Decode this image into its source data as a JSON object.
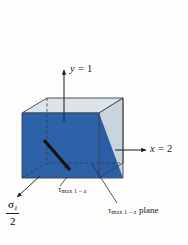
{
  "figure": {
    "name": "maximum-shear-stress-element",
    "background_color": "#fdfdfb",
    "colors": {
      "top_face": "#dde4e9",
      "right_face": "#c9d4dd",
      "shear_plane": "#2e62a8",
      "shear_plane_side": "#2b5ea4",
      "outline": "#3a4149",
      "ink": "#1b1b1b"
    },
    "labels": {
      "y_axis": {
        "var": "y",
        "equals": " = ",
        "value": "1",
        "full": "y = 1"
      },
      "x_axis": {
        "var": "x",
        "equals": " = ",
        "value": "2",
        "full": "x = 2"
      },
      "sigma_fraction": {
        "numerator_symbol": "σ",
        "numerator_subscript": "1",
        "denominator": "2",
        "full": "σ₁/2"
      },
      "tau_bottom": {
        "symbol": "τ",
        "subscript": "max 1 – z",
        "full": "τmax 1 – z"
      },
      "tau_plane": {
        "symbol": "τ",
        "subscript": "max 1 – z",
        "suffix": "plane",
        "full": "τmax 1 – z plane"
      }
    },
    "annotations": {
      "shear_arrow": "shear-direction-arrow",
      "y_arrow": "y-axis-arrow",
      "x_arrow": "x-axis-arrow",
      "sigma_arrow": "sigma-half-leader-arrow",
      "tau_leader": "tau-max-leader-line",
      "tau_plane_leader": "tau-max-plane-leader-line"
    }
  }
}
